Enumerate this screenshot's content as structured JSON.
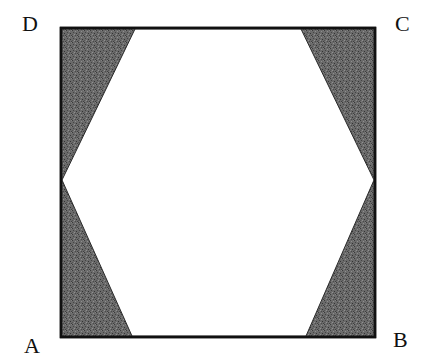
{
  "figure": {
    "type": "geometry-diagram",
    "square": {
      "vertices": {
        "A": [
          61,
          337
        ],
        "B": [
          375,
          337
        ],
        "C": [
          375,
          28
        ],
        "D": [
          61,
          28
        ]
      },
      "stroke": "#111111"
    },
    "hexagon": {
      "vertices": [
        [
          135,
          29
        ],
        [
          301,
          29
        ],
        [
          374,
          180
        ],
        [
          306,
          336
        ],
        [
          132,
          336
        ],
        [
          62,
          180
        ]
      ],
      "fill": "#ffffff"
    },
    "shaded_regions": {
      "count": 4,
      "fill": "#5e5e5e"
    },
    "labels": {
      "A": "A",
      "B": "B",
      "C": "C",
      "D": "D"
    }
  }
}
